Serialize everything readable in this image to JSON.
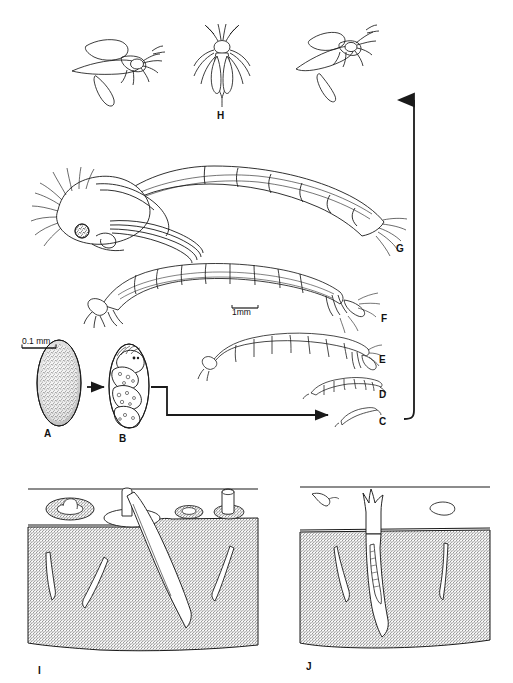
{
  "figure": {
    "background_color": "#ffffff",
    "ink_color": "#1a1a1a",
    "width": 513,
    "height": 683
  },
  "scale_bars": [
    {
      "id": "scale-egg",
      "label": "0.1 mm",
      "x": 22,
      "y": 336,
      "bar_width": 34
    },
    {
      "id": "scale-larva",
      "label": "1mm",
      "x": 232,
      "y": 307,
      "bar_width": 26
    }
  ],
  "stage_labels": [
    {
      "key": "A",
      "text": "A",
      "x": 44,
      "y": 428,
      "stage": "egg"
    },
    {
      "key": "B",
      "text": "B",
      "x": 119,
      "y": 433,
      "stage": "egg-mass-embryo"
    },
    {
      "key": "C",
      "text": "C",
      "x": 379,
      "y": 416,
      "stage": "first-instar-larva"
    },
    {
      "key": "D",
      "text": "D",
      "x": 379,
      "y": 389,
      "stage": "second-instar-larva"
    },
    {
      "key": "E",
      "text": "E",
      "x": 379,
      "y": 354,
      "stage": "third-instar-larva"
    },
    {
      "key": "F",
      "text": "F",
      "x": 381,
      "y": 313,
      "stage": "fourth-instar-larva"
    },
    {
      "key": "G",
      "text": "G",
      "x": 396,
      "y": 243,
      "stage": "pupa"
    },
    {
      "key": "H",
      "text": "H",
      "x": 217,
      "y": 110,
      "stage": "adult-dorsal"
    },
    {
      "key": "I",
      "text": "I",
      "x": 38,
      "y": 665,
      "stage": "habitat-panel-one"
    },
    {
      "key": "J",
      "text": "J",
      "x": 306,
      "y": 661,
      "stage": "habitat-panel-two"
    }
  ],
  "adults": [
    {
      "id": "adult-left",
      "view": "lateral-flight"
    },
    {
      "id": "adult-center",
      "view": "dorsal",
      "label": "H"
    },
    {
      "id": "adult-right",
      "view": "lateral-flight"
    }
  ],
  "arrows": [
    {
      "id": "arrow-a-to-b",
      "type": "straight-right",
      "from": "A",
      "to": "B"
    },
    {
      "id": "arrow-b-to-c",
      "type": "stepped-right",
      "from": "B",
      "to": "C"
    },
    {
      "id": "arrow-cycle-up",
      "type": "long-vertical-up",
      "from": "C",
      "to": "adults"
    }
  ],
  "panels": [
    {
      "id": "panel-I",
      "label": "I",
      "caption_letter": "I",
      "substrate": "dense stippled sediment",
      "features": [
        "open larval tube at surface",
        "retracted tube openings",
        "chimney tube",
        "four larvae in burrows"
      ]
    },
    {
      "id": "panel-J",
      "label": "J",
      "caption_letter": "J",
      "substrate": "dense stippled sediment",
      "features": [
        "frayed silk tube projecting above surface",
        "larva within tube",
        "free larva on surface",
        "detritus particle",
        "two larvae in burrows"
      ]
    }
  ]
}
